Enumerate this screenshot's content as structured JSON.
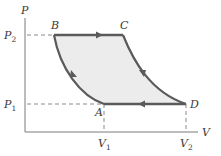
{
  "diagram": {
    "type": "PV cycle diagram",
    "axes": {
      "y_label": "P",
      "x_label": "V"
    },
    "ticks": {
      "p2": {
        "main": "P",
        "sub": "2"
      },
      "p1": {
        "main": "P",
        "sub": "1"
      },
      "v1": {
        "main": "V",
        "sub": "1"
      },
      "v2": {
        "main": "V",
        "sub": "2"
      }
    },
    "points": {
      "a": "A",
      "b": "B",
      "c": "C",
      "d": "D"
    },
    "colors": {
      "curve": "#5a5a5a",
      "fill": "#ececec",
      "axis": "#7a7a7a",
      "dashed": "#8a8a8a"
    },
    "paths": [
      {
        "from": "B",
        "to": "C",
        "kind": "isobaric",
        "direction": "right"
      },
      {
        "from": "C",
        "to": "D",
        "kind": "curve",
        "direction": "down-right"
      },
      {
        "from": "D",
        "to": "A",
        "kind": "isobaric",
        "direction": "left"
      },
      {
        "from": "A",
        "to": "B",
        "kind": "curve",
        "direction": "up-left"
      }
    ]
  }
}
